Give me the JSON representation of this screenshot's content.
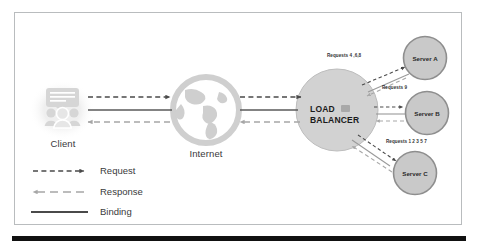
{
  "diagram": {
    "nodes": {
      "client": {
        "label": "Client",
        "icon": "client-users-screen-icon"
      },
      "internet": {
        "label": "Internet",
        "icon": "globe-icon"
      },
      "load_balancer": {
        "label_line1": "LOAD",
        "label_line2": "BALANCER",
        "icon": "load-balancer-badge-icon"
      },
      "servers": [
        {
          "label": "Server A",
          "icon": "server-node-icon"
        },
        {
          "label": "Server B",
          "icon": "server-node-icon"
        },
        {
          "label": "Server C",
          "icon": "server-node-icon"
        }
      ]
    },
    "edge_labels": [
      {
        "text": "Requests 4 ,6,8",
        "target": "Server A"
      },
      {
        "text": "Requests 9",
        "target": "Server B"
      },
      {
        "text": "Requests 1 2 3 5 7",
        "target": "Server C"
      }
    ],
    "legend": {
      "items": [
        {
          "label": "Request",
          "style": "dashed-arrow-right",
          "color": "#4a4a4a"
        },
        {
          "label": "Response",
          "style": "dashed-arrow-left",
          "color": "#a6a6a6"
        },
        {
          "label": "Binding",
          "style": "solid-line",
          "color": "#4a4a4a"
        }
      ]
    },
    "colors": {
      "request": "#4a4a4a",
      "response": "#a6a6a6",
      "binding": "#5a5a5a",
      "node_fill": "#d2d2d2",
      "node_stroke": "#9a9a9a",
      "frame": "#b9bcbe",
      "bottom_bar": "#111111"
    }
  }
}
